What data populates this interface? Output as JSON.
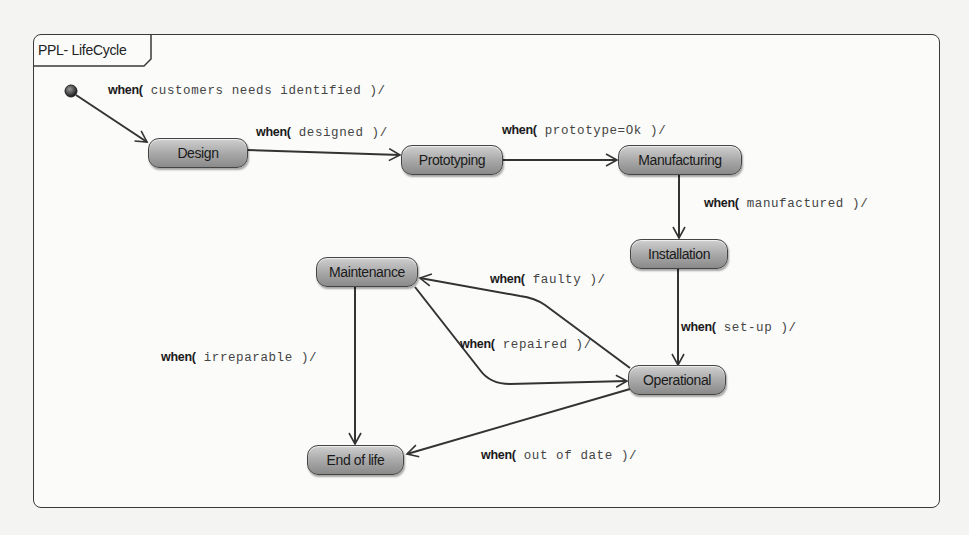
{
  "diagram": {
    "title": "PPL- LifeCycle",
    "type": "UML state machine",
    "colors": {
      "state_fill_top": "#cfcfcf",
      "state_fill_bottom": "#8a8a8a",
      "line": "#333333",
      "frame_border": "#3a3a3a"
    },
    "initial_state": {
      "icon": "initial-state-dot"
    },
    "states": [
      {
        "id": "design",
        "label": "Design"
      },
      {
        "id": "prototyping",
        "label": "Prototyping"
      },
      {
        "id": "manufacturing",
        "label": "Manufacturing"
      },
      {
        "id": "installation",
        "label": "Installation"
      },
      {
        "id": "operational",
        "label": "Operational"
      },
      {
        "id": "maintenance",
        "label": "Maintenance"
      },
      {
        "id": "end_of_life",
        "label": "End of life"
      }
    ],
    "transitions": [
      {
        "from": "initial",
        "to": "design",
        "keyword": "when(",
        "condition": " customers needs identified )/"
      },
      {
        "from": "design",
        "to": "prototyping",
        "keyword": "when(",
        "condition": " designed )/"
      },
      {
        "from": "prototyping",
        "to": "manufacturing",
        "keyword": "when(",
        "condition": " prototype=Ok )/"
      },
      {
        "from": "manufacturing",
        "to": "installation",
        "keyword": "when(",
        "condition": " manufactured )/"
      },
      {
        "from": "installation",
        "to": "operational",
        "keyword": "when(",
        "condition": " set-up )/"
      },
      {
        "from": "operational",
        "to": "maintenance",
        "keyword": "when(",
        "condition": " faulty )/"
      },
      {
        "from": "maintenance",
        "to": "operational",
        "keyword": "when(",
        "condition": " repaired )/"
      },
      {
        "from": "maintenance",
        "to": "end_of_life",
        "keyword": "when(",
        "condition": " irreparable )/"
      },
      {
        "from": "operational",
        "to": "end_of_life",
        "keyword": "when(",
        "condition": " out of date )/"
      }
    ]
  }
}
